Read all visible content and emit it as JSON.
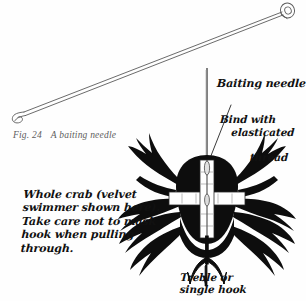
{
  "figure": {
    "number": "Fig. 24",
    "caption": "A baiting needle"
  },
  "labels": {
    "baiting_needle": "Baiting needle",
    "bind_line1": "Bind with",
    "bind_line2": "elasticated",
    "bind_line3": "thread",
    "crab_note": "Whole crab (velvet\nswimmer shown here).\nTake care not to mask\nhook when pulling\nthrough.",
    "hook": "Treble or\nsingle hook"
  },
  "colors": {
    "background": "#fefefe",
    "ink": "#111111",
    "caption_gray": "#5d5d5d",
    "needle_outline": "#555555",
    "crab_body": "#0d0d0d",
    "binding_white": "#ffffff"
  },
  "illustration": {
    "items": [
      "baiting-needle-diagonal",
      "vertical-needle",
      "crab-silhouette",
      "white-binding-cross",
      "treble-hook",
      "leader-line"
    ]
  }
}
